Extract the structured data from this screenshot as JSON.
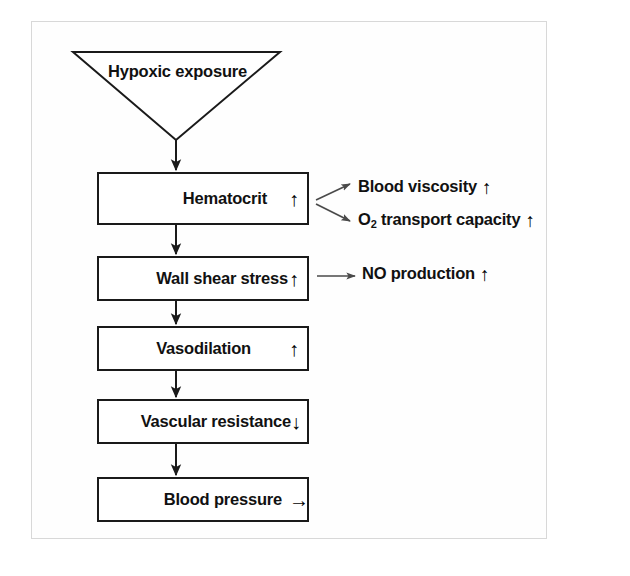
{
  "figure": {
    "type": "flowchart",
    "border_color": "#d8d8d8",
    "line_color": "#1a1a1a"
  },
  "nodes": {
    "trigger": {
      "shape": "inverted-triangle",
      "label": "Hypoxic exposure"
    },
    "hematocrit": {
      "label": "Hematocrit",
      "trend": "↑",
      "trend_name": "increase"
    },
    "wall_shear_stress": {
      "label": "Wall shear stress",
      "trend": "↑",
      "trend_name": "increase"
    },
    "vasodilation": {
      "label": "Vasodilation",
      "trend": "↑",
      "trend_name": "increase"
    },
    "vascular_resistance": {
      "label": "Vascular resistance",
      "trend": "↓",
      "trend_name": "decrease"
    },
    "blood_pressure": {
      "label": "Blood pressure",
      "trend": "→",
      "trend_name": "unchanged"
    }
  },
  "side_effects": {
    "blood_viscosity": {
      "label": "Blood viscosity",
      "trend": "↑",
      "trend_name": "increase"
    },
    "o2_transport_capacity": {
      "label_prefix": "O",
      "label_subscript": "2",
      "label_suffix": " transport capacity",
      "trend": "↑",
      "trend_name": "increase"
    },
    "no_production": {
      "label": "NO production",
      "trend": "↑",
      "trend_name": "increase"
    }
  },
  "connectors": [
    {
      "name": "trigger-to-hematocrit",
      "kind": "vertical-arrow"
    },
    {
      "name": "hematocrit-to-wall-shear",
      "kind": "vertical-arrow"
    },
    {
      "name": "wall-shear-to-vasodilation",
      "kind": "vertical-arrow"
    },
    {
      "name": "vasodilation-to-vascular-resistance",
      "kind": "vertical-arrow"
    },
    {
      "name": "vascular-resistance-to-blood-pressure",
      "kind": "vertical-arrow"
    },
    {
      "name": "hematocrit-to-blood-viscosity",
      "kind": "diagonal-arrow-up"
    },
    {
      "name": "hematocrit-to-o2-transport",
      "kind": "diagonal-arrow-down"
    },
    {
      "name": "wall-shear-to-no-production",
      "kind": "horizontal-arrow"
    }
  ]
}
